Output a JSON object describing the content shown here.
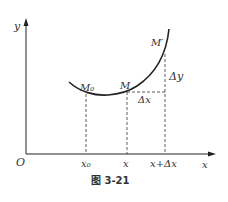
{
  "figure": {
    "caption": "图 3-21",
    "axes": {
      "y_label": "y",
      "x_label": "x",
      "origin_label": "O"
    },
    "x_ticks": [
      "x₀",
      "x",
      "x+Δx"
    ],
    "points": {
      "m0": "M₀",
      "m": "M",
      "m_prime": "M′"
    },
    "increments": {
      "dx": "Δx",
      "dy": "Δy"
    },
    "colors": {
      "stroke": "#222222",
      "text": "#333333"
    }
  }
}
